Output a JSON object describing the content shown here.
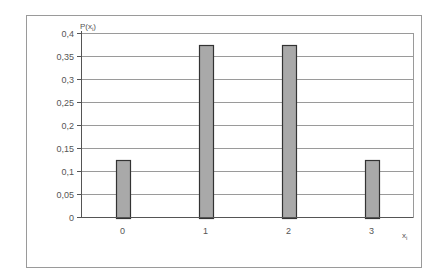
{
  "chart_data": {
    "type": "bar",
    "title": "",
    "xlabel": "x_i",
    "ylabel": "P(x_i)",
    "xlabel_display": {
      "base": "x",
      "sub": "i"
    },
    "ylabel_display": {
      "prefix": "P(x",
      "sub": "i",
      "suffix": ")"
    },
    "categories": [
      "0",
      "1",
      "2",
      "3"
    ],
    "values": [
      0.125,
      0.375,
      0.375,
      0.125
    ],
    "ylim": [
      0,
      0.4
    ],
    "yticks": [
      0,
      0.05,
      0.1,
      0.15,
      0.2,
      0.25,
      0.3,
      0.35,
      0.4
    ],
    "ytick_labels": [
      "0",
      "0,05",
      "0,1",
      "0,15",
      "0,2",
      "0,25",
      "0,3",
      "0,35",
      "0,4"
    ],
    "grid": "horizontal",
    "legend": null
  },
  "colors": {
    "bar_fill": "#a9a9a9",
    "bar_stroke": "#333333",
    "grid": "#9a9a9a",
    "axis": "#555555",
    "frame": "#9a9a9a",
    "text": "#555555"
  }
}
